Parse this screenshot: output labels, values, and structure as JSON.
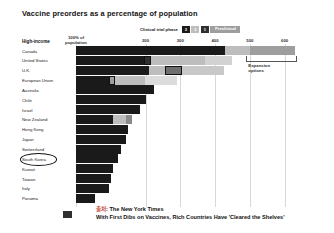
{
  "title": "Vaccine preorders as a percentage of population",
  "legend": {
    "label": "Clinical trial phase",
    "items": [
      {
        "name": "Phase 3",
        "short": "3",
        "color": "#1a1a1a",
        "text_color": "#ffffff"
      },
      {
        "name": "Phase 2",
        "short": "2",
        "color": "#bdbdbd",
        "text_color": "#ffffff"
      },
      {
        "name": "Phase 1",
        "short": "1",
        "color": "#2f2f2f",
        "text_color": "#ffffff"
      },
      {
        "name": "Preclinical",
        "short": "Preclinical",
        "color": "#9e9e9e",
        "text_color": "#ffffff"
      }
    ]
  },
  "axis": {
    "first_tick_line1": "100% of",
    "first_tick_line2": "population",
    "ticks": [
      "200",
      "300",
      "400",
      "500",
      "600"
    ],
    "min": 0,
    "max": 650
  },
  "group_heading": "High-income",
  "annotation": {
    "bracket_label_line1": "Expansion",
    "bracket_label_line2": "options",
    "bracket_from": 490,
    "bracket_to": 630
  },
  "highlight": {
    "country": "South Korea"
  },
  "caption": {
    "source_prefix": "출처",
    "line1": ": The New York Times",
    "line2": "With First Dibs on Vaccines, Rich Countries Have 'Cleared the Shelves'"
  },
  "chart_data": {
    "type": "bar",
    "orientation": "horizontal",
    "stacked": true,
    "title": "Vaccine preorders as a percentage of population",
    "xlabel": "",
    "ylabel": "",
    "xlim": [
      0,
      650
    ],
    "grid": true,
    "legend_position": "top-right",
    "series": [
      {
        "name": "Phase 3",
        "color": "#1a1a1a"
      },
      {
        "name": "Phase 2",
        "color": "#bdbdbd"
      },
      {
        "name": "Phase 1",
        "color": "#2f2f2f"
      },
      {
        "name": "Preclinical",
        "color": "#9e9e9e"
      }
    ],
    "categories": [
      "Canada",
      "United States",
      "U.K.",
      "European Union",
      "Australia",
      "Chile",
      "Israel",
      "New Zealand",
      "Hong Kong",
      "Japan",
      "Switzerland",
      "South Korea",
      "Kuwait",
      "Taiwan",
      "Italy",
      "Panama"
    ],
    "rows": [
      {
        "country": "Canada",
        "total": 630,
        "segments": [
          {
            "phase": "Phase 3",
            "value": 430,
            "color": "#1a1a1a"
          },
          {
            "phase": "Phase 2",
            "value": 70,
            "color": "#bdbdbd"
          },
          {
            "phase": "Preclinical",
            "value": 130,
            "color": "#9e9e9e"
          }
        ]
      },
      {
        "country": "United States",
        "total": 450,
        "segments": [
          {
            "phase": "Phase 3",
            "value": 195,
            "color": "#1a1a1a"
          },
          {
            "phase": "Phase 1",
            "value": 20,
            "color": "#2f2f2f",
            "outlined": true
          },
          {
            "phase": "Phase 2",
            "value": 155,
            "color": "#bdbdbd"
          },
          {
            "phase": "Preclinical",
            "value": 80,
            "color": "#d2d2d2"
          }
        ]
      },
      {
        "country": "U.K.",
        "total": 425,
        "segments": [
          {
            "phase": "Phase 3",
            "value": 210,
            "color": "#1a1a1a"
          },
          {
            "phase": "Phase 2",
            "value": 45,
            "color": "#bdbdbd"
          },
          {
            "phase": "Phase 1",
            "value": 50,
            "color": "#6e6e6e",
            "outlined": true
          },
          {
            "phase": "Preclinical",
            "value": 120,
            "color": "#c8c8c8"
          }
        ]
      },
      {
        "country": "European Union",
        "total": 290,
        "segments": [
          {
            "phase": "Phase 3",
            "value": 95,
            "color": "#1a1a1a"
          },
          {
            "phase": "Phase 1",
            "value": 18,
            "color": "#9e9e9e",
            "outlined": true
          },
          {
            "phase": "Phase 2",
            "value": 85,
            "color": "#bdbdbd"
          },
          {
            "phase": "Preclinical",
            "value": 92,
            "color": "#dcdcdc"
          }
        ]
      },
      {
        "country": "Australia",
        "total": 225,
        "segments": [
          {
            "phase": "Phase 3",
            "value": 225,
            "color": "#1a1a1a"
          }
        ]
      },
      {
        "country": "Chile",
        "total": 200,
        "segments": [
          {
            "phase": "Phase 3",
            "value": 200,
            "color": "#1a1a1a"
          }
        ]
      },
      {
        "country": "Israel",
        "total": 185,
        "segments": [
          {
            "phase": "Phase 3",
            "value": 185,
            "color": "#1a1a1a"
          }
        ]
      },
      {
        "country": "New Zealand",
        "total": 160,
        "segments": [
          {
            "phase": "Phase 3",
            "value": 105,
            "color": "#1a1a1a"
          },
          {
            "phase": "Phase 2",
            "value": 40,
            "color": "#bdbdbd"
          },
          {
            "phase": "Preclinical",
            "value": 15,
            "color": "#8a8a8a"
          }
        ]
      },
      {
        "country": "Hong Kong",
        "total": 150,
        "segments": [
          {
            "phase": "Phase 3",
            "value": 150,
            "color": "#1a1a1a"
          }
        ]
      },
      {
        "country": "Japan",
        "total": 145,
        "segments": [
          {
            "phase": "Phase 3",
            "value": 145,
            "color": "#1a1a1a"
          }
        ]
      },
      {
        "country": "Switzerland",
        "total": 130,
        "segments": [
          {
            "phase": "Phase 3",
            "value": 130,
            "color": "#1a1a1a"
          }
        ]
      },
      {
        "country": "South Korea",
        "total": 120,
        "segments": [
          {
            "phase": "Phase 3",
            "value": 120,
            "color": "#1a1a1a"
          }
        ]
      },
      {
        "country": "Kuwait",
        "total": 105,
        "segments": [
          {
            "phase": "Phase 3",
            "value": 105,
            "color": "#1a1a1a"
          }
        ]
      },
      {
        "country": "Taiwan",
        "total": 100,
        "segments": [
          {
            "phase": "Phase 3",
            "value": 100,
            "color": "#1a1a1a"
          }
        ]
      },
      {
        "country": "Italy",
        "total": 95,
        "segments": [
          {
            "phase": "Phase 3",
            "value": 95,
            "color": "#1a1a1a"
          }
        ]
      },
      {
        "country": "Panama",
        "total": 55,
        "segments": [
          {
            "phase": "Phase 3",
            "value": 55,
            "color": "#1a1a1a"
          }
        ]
      }
    ]
  }
}
